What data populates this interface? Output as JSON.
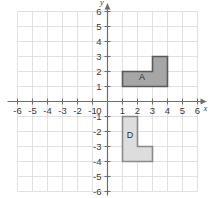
{
  "figure": {
    "background_color": "#ffffff",
    "grid_color": "#d9d9d9",
    "axis_color": "#6e6e6e",
    "label_color": "#3b3b3b"
  },
  "chart_data": {
    "type": "scatter",
    "title": "",
    "xlabel": "x",
    "ylabel": "y",
    "xlim": [
      -6,
      6
    ],
    "ylim": [
      -6,
      6
    ],
    "grid": true,
    "legend": "none",
    "x_ticks": [
      "-6",
      "-5",
      "-4",
      "-3",
      "-2",
      "-1",
      "1",
      "2",
      "3",
      "4",
      "5",
      "6"
    ],
    "y_ticks": [
      "6",
      "5",
      "4",
      "3",
      "2",
      "1",
      "-1",
      "-2",
      "-3",
      "-4",
      "-5",
      "-6"
    ],
    "origin_label": "0",
    "x_tick_values": [
      -6,
      -5,
      -4,
      -3,
      -2,
      -1,
      1,
      2,
      3,
      4,
      5,
      6
    ],
    "y_tick_values": [
      6,
      5,
      4,
      3,
      2,
      1,
      -1,
      -2,
      -3,
      -4,
      -5,
      -6
    ],
    "shapes": [
      {
        "label": "A",
        "fill": "#a6a6a6",
        "stroke": "#5a5a5a",
        "label_x": 2.3,
        "label_y": 1.45,
        "vertices": [
          [
            1,
            2
          ],
          [
            3,
            2
          ],
          [
            3,
            3
          ],
          [
            4,
            3
          ],
          [
            4,
            1
          ],
          [
            1,
            1
          ]
        ]
      },
      {
        "label": "D",
        "fill": "#dddddd",
        "stroke": "#8a8a8a",
        "label_x": 1.5,
        "label_y": -2.4,
        "vertices": [
          [
            1,
            -1
          ],
          [
            2,
            -1
          ],
          [
            2,
            -3
          ],
          [
            3,
            -3
          ],
          [
            3,
            -4
          ],
          [
            1,
            -4
          ]
        ]
      }
    ]
  }
}
